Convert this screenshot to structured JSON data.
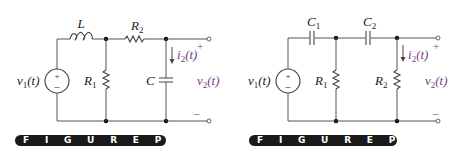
{
  "figures": [
    {
      "id": "left",
      "caption": "FIGURE P10-31",
      "caption_display": "F I G U R E   P 1 0 – 3 1",
      "labels": {
        "inductor": "L",
        "resistor_series": "R",
        "resistor_series_sub": "2",
        "resistor_shunt": "R",
        "resistor_shunt_sub": "1",
        "capacitor": "C",
        "source": "v",
        "source_sub": "1",
        "source_arg": "(t)",
        "current": "i",
        "current_sub": "2",
        "current_arg": "(t)",
        "output": "v",
        "output_sub": "2",
        "output_arg": "(t)",
        "plus": "+",
        "minus": "–"
      }
    },
    {
      "id": "right",
      "caption": "FIGURE P10-33",
      "caption_display": "F I G U R E   P 1 0 – 3 3",
      "labels": {
        "cap1": "C",
        "cap1_sub": "1",
        "cap2": "C",
        "cap2_sub": "2",
        "resistor_shunt1": "R",
        "resistor_shunt1_sub": "1",
        "resistor_shunt2": "R",
        "resistor_shunt2_sub": "2",
        "source": "v",
        "source_sub": "1",
        "source_arg": "(t)",
        "current": "i",
        "current_sub": "2",
        "current_arg": "(t)",
        "output": "v",
        "output_sub": "2",
        "output_arg": "(t)",
        "plus": "+",
        "minus": "–"
      }
    }
  ],
  "colors": {
    "wire": "#555555",
    "accent_purple": "#7a3a8a",
    "caption_bg": "#1a1a1a"
  }
}
